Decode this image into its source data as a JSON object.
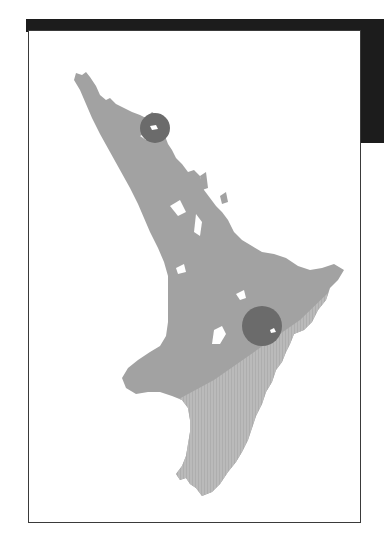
{
  "map": {
    "title": "",
    "region": "North Island, New Zealand",
    "colors": {
      "frame_bar": "#1c1c1c",
      "frame_border": "#3a3a3a",
      "land_primary": "#a2a2a2",
      "land_secondary": "#b8b8b8",
      "marker": "#6b6b6b",
      "water": "#ffffff"
    },
    "zones": [
      {
        "id": "north-west-zone",
        "shade": "land_primary"
      },
      {
        "id": "south-east-zone",
        "shade": "land_secondary",
        "pattern": "vertical-stripes"
      }
    ],
    "markers": [
      {
        "id": "marker-north",
        "cx": 155,
        "cy": 128,
        "r": 15
      },
      {
        "id": "marker-east",
        "cx": 262,
        "cy": 326,
        "r": 20
      }
    ]
  }
}
